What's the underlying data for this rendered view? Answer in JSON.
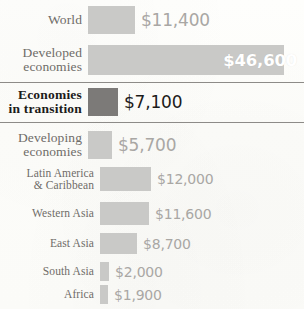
{
  "chart_data": {
    "type": "bar",
    "orientation": "horizontal",
    "title": "",
    "subtitle": "",
    "xlabel": "",
    "ylabel": "",
    "unit": "$",
    "grid": false,
    "legend_position": "none",
    "xlim": [
      0,
      46600
    ],
    "categories": [
      "World",
      "Developed economies",
      "Economies in transition",
      "Developing economies",
      "Latin America & Caribbean",
      "Western Asia",
      "East Asia",
      "South Asia",
      "Africa"
    ],
    "values": [
      11400,
      46600,
      7100,
      5700,
      12000,
      11600,
      8700,
      2000,
      1900
    ],
    "value_labels": [
      "$11,400",
      "$46,600",
      "$7,100",
      "$5,700",
      "$12,000",
      "$11,600",
      "$8,700",
      "$2,000",
      "$1,900"
    ]
  },
  "colors": {
    "background": "#fdfdfa",
    "bar_light": "#c9c9c7",
    "bar_dark": "#7c7a78",
    "label_text": "#6f6c68",
    "value_text": "#a9a7a4",
    "highlight_text": "#1c1b1a",
    "value_inside": "#ffffff",
    "separator": "#8d8b88"
  },
  "rows": {
    "world": {
      "label_line1": "World",
      "label_line2": "",
      "value": "$11,400"
    },
    "developed": {
      "label_line1": "Developed",
      "label_line2": "economies",
      "value": "$46,600"
    },
    "transition": {
      "label_line1": "Economies",
      "label_line2": "in transition",
      "value": "$7,100"
    },
    "developing": {
      "label_line1": "Developing",
      "label_line2": "economies",
      "value": "$5,700"
    },
    "latin": {
      "label_line1": "Latin America",
      "label_line2": "& Caribbean",
      "value": "$12,000"
    },
    "western": {
      "label_line1": "Western Asia",
      "label_line2": "",
      "value": "$11,600"
    },
    "east": {
      "label_line1": "East Asia",
      "label_line2": "",
      "value": "$8,700"
    },
    "south": {
      "label_line1": "South Asia",
      "label_line2": "",
      "value": "$2,000"
    },
    "africa": {
      "label_line1": "Africa",
      "label_line2": "",
      "value": "$1,900"
    }
  },
  "bar_widths_px": {
    "world": 47,
    "developed": 196,
    "transition": 30,
    "developing": 24,
    "latin": 51,
    "western": 49,
    "east": 37,
    "south": 9,
    "africa": 8
  }
}
